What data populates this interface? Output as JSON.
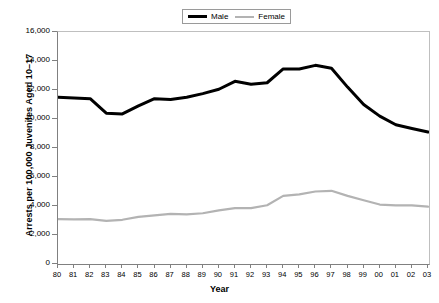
{
  "chart_data": {
    "type": "line",
    "title": "",
    "xlabel": "Year",
    "ylabel": "Arrests per 100,000 Juveniles Aged 10–17",
    "categories": [
      "80",
      "81",
      "82",
      "83",
      "84",
      "85",
      "86",
      "87",
      "88",
      "89",
      "90",
      "91",
      "92",
      "93",
      "94",
      "95",
      "96",
      "97",
      "98",
      "99",
      "00",
      "01",
      "02",
      "03"
    ],
    "ylim": [
      0,
      16000
    ],
    "yticks": [
      0,
      2000,
      4000,
      6000,
      8000,
      10000,
      12000,
      14000,
      16000
    ],
    "ytick_labels": [
      "0",
      "2,000",
      "4,000",
      "6,000",
      "8,000",
      "10,000",
      "12,000",
      "14,000",
      "16,000"
    ],
    "grid": false,
    "legend_position": "top-center",
    "series": [
      {
        "name": "Male",
        "color": "#000000",
        "values": [
          11500,
          11450,
          11400,
          10400,
          10350,
          10900,
          11400,
          11350,
          11500,
          11750,
          12050,
          12600,
          12400,
          12500,
          13450,
          13450,
          13700,
          13500,
          12200,
          11000,
          10200,
          9600,
          9350,
          9100
        ]
      },
      {
        "name": "Female",
        "color": "#b3b3b3",
        "values": [
          3100,
          3080,
          3100,
          2980,
          3050,
          3250,
          3350,
          3450,
          3420,
          3500,
          3700,
          3850,
          3850,
          4050,
          4700,
          4800,
          5000,
          5050,
          4700,
          4400,
          4100,
          4050,
          4050,
          3950
        ]
      }
    ]
  },
  "legend": {
    "entries": [
      {
        "label": "Male"
      },
      {
        "label": "Female"
      }
    ]
  },
  "axes": {
    "y_title": "Arrests per 100,000 Juveniles Aged 10–17",
    "x_title": "Year"
  }
}
